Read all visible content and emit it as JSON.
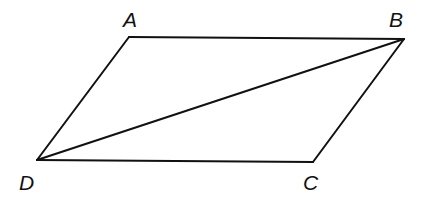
{
  "diagram": {
    "type": "parallelogram-with-diagonal",
    "stroke_color": "#111111",
    "background": "#ffffff",
    "vertices": [
      {
        "id": "A",
        "label": "A",
        "x": 129,
        "y": 37,
        "label_x": 123,
        "label_y": 27
      },
      {
        "id": "B",
        "label": "B",
        "x": 404,
        "y": 39,
        "label_x": 389,
        "label_y": 27
      },
      {
        "id": "C",
        "label": "C",
        "x": 313,
        "y": 162,
        "label_x": 303,
        "label_y": 190
      },
      {
        "id": "D",
        "label": "D",
        "x": 37,
        "y": 160,
        "label_x": 19,
        "label_y": 190
      }
    ],
    "segments": [
      {
        "from": "A",
        "to": "B"
      },
      {
        "from": "B",
        "to": "C"
      },
      {
        "from": "C",
        "to": "D"
      },
      {
        "from": "D",
        "to": "A"
      },
      {
        "from": "D",
        "to": "B",
        "kind": "diagonal"
      }
    ]
  }
}
